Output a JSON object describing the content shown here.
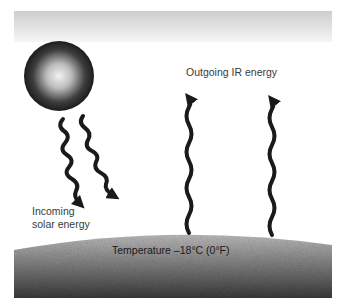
{
  "diagram": {
    "labels": {
      "outgoing": "Outgoing IR energy",
      "incoming_line1": "Incoming",
      "incoming_line2": "solar energy",
      "temperature": "Temperature –18°C (0°F)"
    },
    "elements": {
      "sun": "sun-sphere",
      "atmosphere": "atmosphere-band",
      "ground": "earth-surface",
      "incoming_arrows": 2,
      "outgoing_arrows": 2
    },
    "colors": {
      "arrow": "#1a1a1a",
      "band_top": "#cfcfcf",
      "band_bottom": "#f4f4f4",
      "ground_dark": "#3c3c3c",
      "ground_light": "#b9b9b9"
    }
  }
}
